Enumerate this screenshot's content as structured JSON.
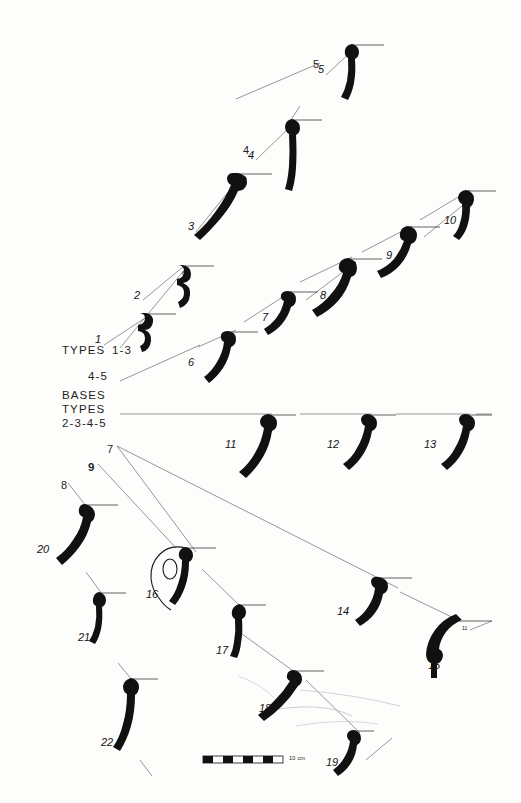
{
  "plate": {
    "title": "Pottery rim and base profile typology plate",
    "background_color": "#fdfdfc",
    "ink_color": "#111111",
    "line_color": "#555555"
  },
  "legend": {
    "blocks": [
      {
        "name": "types-upper",
        "lines": [
          "TYPES"
        ],
        "x": 62,
        "y": 349
      },
      {
        "name": "types-range-1-3",
        "lines": [
          "1-3"
        ],
        "x": 112,
        "y": 349
      },
      {
        "name": "types-range-4-5",
        "lines": [
          "4-5"
        ],
        "x": 88,
        "y": 375
      },
      {
        "name": "bases-block",
        "lines": [
          "BASES",
          "TYPES",
          "2-3-4-5"
        ],
        "x": 62,
        "y": 392
      }
    ]
  },
  "leader_labels": [
    {
      "name": "leader-4",
      "text": "4",
      "x": 243,
      "y": 143,
      "bold": false
    },
    {
      "name": "leader-5",
      "text": "5",
      "x": 313,
      "y": 57,
      "bold": false
    },
    {
      "name": "leader-7-fan",
      "text": "7",
      "x": 107,
      "y": 442,
      "bold": false
    },
    {
      "name": "leader-9-fan",
      "text": "9",
      "x": 88,
      "y": 460,
      "bold": true
    },
    {
      "name": "leader-8-item20",
      "text": "8",
      "x": 61,
      "y": 478,
      "bold": false
    }
  ],
  "items": [
    {
      "num": "1",
      "type": "6",
      "nx": 95,
      "ny": 332,
      "tx": 146,
      "ty": 318,
      "rim": 150,
      "ry": 314
    },
    {
      "num": "2",
      "type": "6",
      "nx": 134,
      "ny": 288,
      "tx": 182,
      "ty": 270,
      "rim": 186,
      "ry": 266
    },
    {
      "num": "3",
      "type": "6",
      "nx": 188,
      "ny": 219,
      "tx": 238,
      "ty": 178,
      "rim": 242,
      "ry": 174
    },
    {
      "num": "4",
      "type": "7",
      "nx": 248,
      "ny": 148,
      "tx": 292,
      "ty": 124,
      "rim": 296,
      "ry": 120
    },
    {
      "num": "5",
      "type": "5",
      "nx": 318,
      "ny": 62,
      "tx": 352,
      "ty": 49,
      "rim": 356,
      "ry": 45
    },
    {
      "num": "6",
      "type": "6",
      "nx": 188,
      "ny": 355,
      "tx": 228,
      "ty": 336,
      "rim": 232,
      "ry": 332
    },
    {
      "num": "7",
      "type": "5",
      "nx": 262,
      "ny": 310,
      "tx": 288,
      "ty": 296,
      "rim": 292,
      "ry": 292
    },
    {
      "num": "8",
      "type": "6",
      "nx": 320,
      "ny": 288,
      "tx": 348,
      "ty": 263,
      "rim": 352,
      "ry": 259
    },
    {
      "num": "9",
      "type": "6",
      "nx": 386,
      "ny": 248,
      "tx": 408,
      "ty": 231,
      "rim": 412,
      "ry": 227
    },
    {
      "num": "10",
      "type": "6",
      "nx": 444,
      "ny": 213,
      "tx": 466,
      "ty": 195,
      "rim": 470,
      "ry": 191
    },
    {
      "num": "11",
      "type": "5",
      "nx": 225,
      "ny": 437,
      "tx": 268,
      "ty": 419,
      "rim": 272,
      "ry": 415
    },
    {
      "num": "12",
      "type": "6",
      "nx": 327,
      "ny": 437,
      "tx": 368,
      "ty": 419,
      "rim": 372,
      "ry": 415
    },
    {
      "num": "13",
      "type": "6",
      "nx": 424,
      "ny": 437,
      "tx": 466,
      "ty": 419,
      "rim": 470,
      "ry": 415
    },
    {
      "num": "14",
      "type": "6",
      "nx": 337,
      "ny": 604,
      "tx": 379,
      "ty": 582,
      "rim": 383,
      "ry": 578
    },
    {
      "num": "15",
      "type": "11",
      "nx": 428,
      "ny": 658,
      "tx": 462,
      "ty": 625,
      "rim": 466,
      "ry": 621
    },
    {
      "num": "16",
      "type": "1",
      "nx": 146,
      "ny": 587,
      "tx": 186,
      "ty": 552,
      "rim": 190,
      "ry": 548
    },
    {
      "num": "17",
      "type": "4",
      "nx": 216,
      "ny": 643,
      "tx": 239,
      "ty": 609,
      "rim": 243,
      "ry": 605
    },
    {
      "num": "18",
      "type": "2,5",
      "nx": 259,
      "ny": 701,
      "tx": 294,
      "ty": 675,
      "rim": 298,
      "ry": 671
    },
    {
      "num": "19",
      "type": "2",
      "nx": 326,
      "ny": 755,
      "tx": 354,
      "ty": 735,
      "rim": 358,
      "ry": 731
    },
    {
      "num": "20",
      "type": "4",
      "nx": 37,
      "ny": 542,
      "tx": 85,
      "ty": 509,
      "rim": 89,
      "ry": 505
    },
    {
      "num": "21",
      "type": "3",
      "nx": 78,
      "ny": 630,
      "tx": 99,
      "ty": 597,
      "rim": 103,
      "ry": 593
    },
    {
      "num": "22",
      "type": "2",
      "nx": 101,
      "ny": 735,
      "tx": 131,
      "ty": 683,
      "rim": 135,
      "ry": 679
    }
  ],
  "scale_bar": {
    "label": "10 cm",
    "x": 203,
    "y": 756,
    "width": 80,
    "height": 7,
    "segments": 8
  }
}
